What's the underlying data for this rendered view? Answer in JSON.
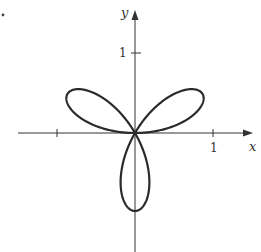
{
  "chart_data": {
    "type": "line",
    "title": "",
    "xlabel": "x",
    "ylabel": "y",
    "equation": "r = sin(3θ)",
    "curve": "three-leaved rose (polar)",
    "petal_directions_deg": [
      30,
      150,
      270
    ],
    "petal_length": 1,
    "xlim": [
      -1.5,
      1.5
    ],
    "ylim": [
      -1.5,
      1.6
    ],
    "x_ticks": [
      -1,
      1
    ],
    "x_tick_labels": [
      "",
      "1"
    ],
    "y_ticks": [
      1
    ],
    "y_tick_labels": [
      "1"
    ],
    "grid": false,
    "legend": null
  },
  "labels": {
    "x_axis": "x",
    "y_axis": "y",
    "x_tick_one": "1",
    "y_tick_one": "1"
  },
  "layout": {
    "origin_px": [
      135,
      133
    ],
    "scale_px_per_unit": 78,
    "stroke_color": "#2b2b2b"
  }
}
